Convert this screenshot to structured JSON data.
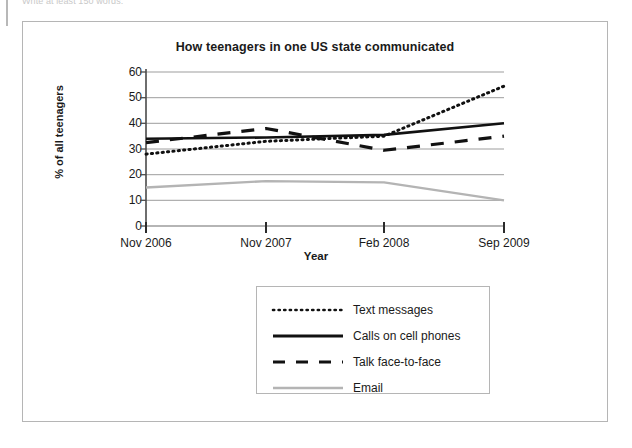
{
  "page": {
    "top_instruction": "Write at least 150 words."
  },
  "chart_data": {
    "type": "line",
    "title": "How teenagers in one US state communicated",
    "xlabel": "Year",
    "ylabel": "% of all teenagers",
    "categories": [
      "Nov 2006",
      "Nov 2007",
      "Feb 2008",
      "Sep 2009"
    ],
    "x_tick_labels": [
      "Nov 2006",
      "Nov 2007",
      "Feb 2008",
      "Sep 2009"
    ],
    "y_tick_labels": [
      "0",
      "10",
      "20",
      "30",
      "40",
      "50",
      "60"
    ],
    "y_ticks": [
      0,
      10,
      20,
      30,
      40,
      50,
      60
    ],
    "ylim": [
      0,
      60
    ],
    "grid": true,
    "legend_position": "below-plot",
    "series": [
      {
        "name": "Text messages",
        "style": "dotted",
        "color": "#111111",
        "values": [
          28,
          33,
          35,
          54.5
        ]
      },
      {
        "name": "Calls on cell phones",
        "style": "solid",
        "color": "#111111",
        "values": [
          34,
          34.5,
          35.5,
          40
        ]
      },
      {
        "name": "Talk face-to-face",
        "style": "dashed",
        "color": "#111111",
        "values": [
          32.5,
          38,
          29.5,
          35
        ]
      },
      {
        "name": "Email",
        "style": "solid-light",
        "color": "#b4b4b4",
        "values": [
          15,
          17.5,
          17,
          10
        ]
      }
    ]
  }
}
